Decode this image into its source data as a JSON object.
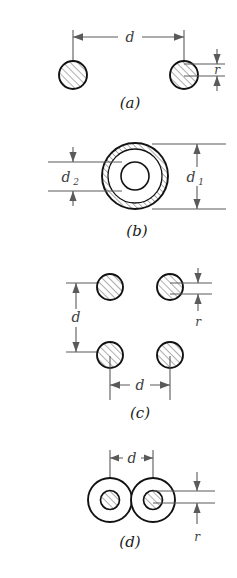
{
  "figure": {
    "background_color": "#ffffff",
    "line_color": "#121212",
    "dimension_color": "#5a5a5a",
    "width": 237,
    "height": 578
  },
  "panels": [
    {
      "id": "a",
      "caption": "(a)",
      "description": "two solid hatched conductors separated by distance d",
      "dimensions": [
        {
          "name": "d",
          "label": "d",
          "kind": "horizontal",
          "meaning": "center-to-center spacing"
        },
        {
          "name": "r",
          "label": "r",
          "kind": "vertical",
          "meaning": "conductor radius"
        }
      ],
      "shapes": [
        {
          "kind": "hatched-circle",
          "cx": 73,
          "cy": 75,
          "r": 14
        },
        {
          "kind": "hatched-circle",
          "cx": 184,
          "cy": 75,
          "r": 14
        }
      ]
    },
    {
      "id": "b",
      "caption": "(b)",
      "description": "hollow annular conductor with outer diameter d1 and inner diameter d2",
      "dimensions": [
        {
          "name": "d2",
          "label": "d",
          "sub": "2",
          "kind": "vertical",
          "meaning": "inner bore diameter"
        },
        {
          "name": "d1",
          "label": "d",
          "sub": "1",
          "kind": "vertical",
          "meaning": "outer diameter"
        }
      ],
      "shapes": [
        {
          "kind": "hatched-annulus",
          "cx": 135,
          "cy": 176,
          "r_outer": 33,
          "r_inner": 27
        },
        {
          "kind": "circle",
          "cx": 135,
          "cy": 176,
          "r": 14
        }
      ]
    },
    {
      "id": "c",
      "caption": "(c)",
      "description": "four hatched conductors arranged on a square of side d",
      "dimensions": [
        {
          "name": "d-vertical",
          "label": "d",
          "kind": "vertical",
          "meaning": "vertical spacing"
        },
        {
          "name": "d-horizontal",
          "label": "d",
          "kind": "horizontal",
          "meaning": "horizontal spacing"
        },
        {
          "name": "r",
          "label": "r",
          "kind": "vertical",
          "meaning": "conductor radius"
        }
      ],
      "shapes": [
        {
          "kind": "hatched-circle",
          "cx": 110,
          "cy": 287,
          "r": 13
        },
        {
          "kind": "hatched-circle",
          "cx": 170,
          "cy": 287,
          "r": 13
        },
        {
          "kind": "hatched-circle",
          "cx": 110,
          "cy": 355,
          "r": 13
        },
        {
          "kind": "hatched-circle",
          "cx": 170,
          "cy": 355,
          "r": 13
        }
      ]
    },
    {
      "id": "d",
      "caption": "(d)",
      "description": "two touching conductors each with a hatched core, spacing d",
      "dimensions": [
        {
          "name": "d",
          "label": "d",
          "kind": "horizontal",
          "meaning": "center-to-center spacing"
        },
        {
          "name": "r",
          "label": "r",
          "kind": "vertical",
          "meaning": "core radius"
        }
      ],
      "shapes": [
        {
          "kind": "circle",
          "cx": 110,
          "cy": 500,
          "r": 22
        },
        {
          "kind": "circle",
          "cx": 153,
          "cy": 500,
          "r": 22
        },
        {
          "kind": "hatched-circle",
          "cx": 110,
          "cy": 500,
          "r": 9.5
        },
        {
          "kind": "hatched-circle",
          "cx": 153,
          "cy": 500,
          "r": 9.5
        }
      ]
    }
  ],
  "labels": {
    "d": "d",
    "r": "r",
    "d_base": "d",
    "sub_1": "1",
    "sub_2": "2",
    "caption_a": "(a)",
    "caption_b": "(b)",
    "caption_c": "(c)",
    "caption_d": "(d)"
  }
}
